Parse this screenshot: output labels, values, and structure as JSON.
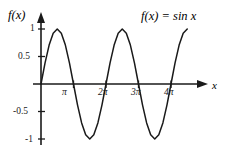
{
  "figure": {
    "axis_labels": {
      "y": "f(x)",
      "x": "x"
    },
    "equation": "f(x) = sin x"
  },
  "chart_data": {
    "type": "line",
    "title": "f(x) = sin x",
    "xlabel": "x",
    "ylabel": "f(x)",
    "xlim": [
      0,
      14.137
    ],
    "ylim": [
      -1,
      1
    ],
    "grid": false,
    "legend": "none",
    "annotation": "f(x) = sin x",
    "x_ticks": [
      {
        "value": 3.1416,
        "label": "π"
      },
      {
        "value": 6.2832,
        "label": "2π"
      },
      {
        "value": 9.4248,
        "label": "3π"
      },
      {
        "value": 12.5664,
        "label": "4π"
      }
    ],
    "y_ticks": [
      {
        "value": 1,
        "label": "1"
      },
      {
        "value": 0.5,
        "label": "0.5"
      },
      {
        "value": -0.5,
        "label": "-0.5"
      },
      {
        "value": -1,
        "label": "-1"
      }
    ],
    "series": [
      {
        "name": "sin x",
        "color": "#1a1a1a",
        "x": [
          0,
          0.3927,
          0.7854,
          1.1781,
          1.5708,
          1.9635,
          2.3562,
          2.7489,
          3.1416,
          3.5343,
          3.927,
          4.3197,
          4.7124,
          5.1051,
          5.4978,
          5.8905,
          6.2832,
          6.6759,
          7.0686,
          7.4613,
          7.854,
          8.2467,
          8.6394,
          9.0321,
          9.4248,
          9.8175,
          10.2102,
          10.6029,
          10.9956,
          11.3883,
          11.781,
          12.1737,
          12.5664,
          12.9591,
          13.3518,
          13.7445,
          14.137
        ],
        "y": [
          0,
          0.3827,
          0.7071,
          0.9239,
          1,
          0.9239,
          0.7071,
          0.3827,
          0,
          -0.3827,
          -0.7071,
          -0.9239,
          -1,
          -0.9239,
          -0.7071,
          -0.3827,
          0,
          0.3827,
          0.7071,
          0.9239,
          1,
          0.9239,
          0.7071,
          0.3827,
          0,
          -0.3827,
          -0.7071,
          -0.9239,
          -1,
          -0.9239,
          -0.7071,
          -0.3827,
          0,
          0.3827,
          0.7071,
          0.9239,
          1
        ]
      }
    ]
  },
  "ticks": {
    "y1": "1",
    "y05": "0.5",
    "yn05": "-0.5",
    "yn1": "-1",
    "xpi": "π",
    "x2pi": "2π",
    "x3pi": "3π",
    "x4pi": "4π"
  },
  "colors": {
    "curve": "#1a1a1a",
    "axis": "#1a1a1a",
    "background": "#ffffff"
  }
}
